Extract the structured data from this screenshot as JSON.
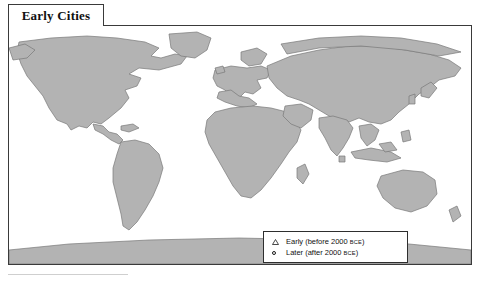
{
  "map": {
    "title": "Early Cities",
    "land_color": "#b0b0b0",
    "land_stroke": "#6e6e6e",
    "ocean_color": "#ffffff",
    "frame_color": "#3a3a3a",
    "projection_note": "world map, equirectangular-like"
  },
  "legend": {
    "box_border": "#2e2e2e",
    "entries": [
      {
        "symbol": "triangle",
        "label_main": "Early (before 2000 ",
        "label_era": "BCE",
        "label_tail": ")"
      },
      {
        "symbol": "circle",
        "label_main": "Later (after 2000 ",
        "label_era": "BCE",
        "label_tail": ")"
      }
    ]
  },
  "cities": [
    {
      "name": "Cahokia",
      "symbol": "circle",
      "label_x": 78,
      "label_y": 68,
      "marker_x": 116,
      "marker_y": 72
    },
    {
      "name": "Teotihuacán",
      "symbol": "circle",
      "label_x": 36,
      "label_y": 95,
      "marker_x": 86,
      "marker_y": 100
    },
    {
      "name": "Tikal",
      "symbol": "circle",
      "label_x": 57,
      "label_y": 112,
      "marker_x": 100,
      "marker_y": 106
    },
    {
      "name": "Chavín de",
      "symbol": "circle",
      "label_x": 117,
      "label_y": 159,
      "marker_x": 113,
      "marker_y": 158
    },
    {
      "name": "Huantar",
      "symbol": "none",
      "label_x": 117,
      "label_y": 167,
      "marker_x": 0,
      "marker_y": 0
    },
    {
      "name": "Jenne Jeno",
      "symbol": "circle",
      "label_x": 199,
      "label_y": 119,
      "marker_x": 194,
      "marker_y": 118
    },
    {
      "name": "Paris",
      "symbol": "circle",
      "label_x": 211,
      "label_y": 61,
      "marker_x": 237,
      "marker_y": 66
    },
    {
      "name": "Athens",
      "symbol": "triangle",
      "label_x": 246,
      "label_y": 60,
      "marker_x": 255,
      "marker_y": 70
    },
    {
      "name": "Rome",
      "symbol": "circle",
      "label_x": 219,
      "label_y": 71,
      "marker_x": 245,
      "marker_y": 75
    },
    {
      "name": "Knossos",
      "symbol": "triangle",
      "label_x": 225,
      "label_y": 80,
      "marker_x": 255,
      "marker_y": 82
    },
    {
      "name": "Harappa",
      "symbol": "triangle",
      "label_x": 318,
      "label_y": 84,
      "marker_x": 312,
      "marker_y": 84
    },
    {
      "name": "Anyang",
      "symbol": "triangle",
      "label_x": 351,
      "label_y": 75,
      "marker_x": 385,
      "marker_y": 80
    },
    {
      "name": "Ch'ang-an",
      "symbol": "circle",
      "label_x": 385,
      "label_y": 88,
      "marker_x": 380,
      "marker_y": 87
    },
    {
      "name": "Lothal",
      "symbol": "triangle",
      "label_x": 315,
      "label_y": 104,
      "marker_x": 314,
      "marker_y": 96
    },
    {
      "name": "Mohenjo",
      "symbol": "triangle",
      "label_x": 294,
      "label_y": 113,
      "marker_x": 303,
      "marker_y": 93
    },
    {
      "name": "Daro",
      "symbol": "none",
      "label_x": 299,
      "label_y": 121,
      "marker_x": 0,
      "marker_y": 0
    },
    {
      "name": "Pataliputra",
      "symbol": "circle",
      "label_x": 341,
      "label_y": 103,
      "marker_x": 336,
      "marker_y": 99
    },
    {
      "name": "Madurai",
      "symbol": "circle",
      "label_x": 335,
      "label_y": 124,
      "marker_x": 329,
      "marker_y": 122
    }
  ]
}
